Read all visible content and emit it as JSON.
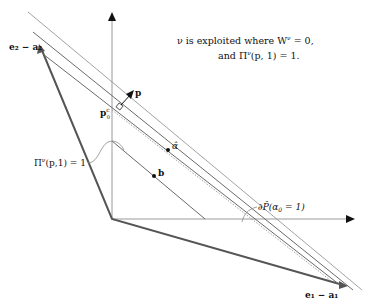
{
  "annotation": {
    "line1": "ν is exploited where W",
    "line1_sup": "ν",
    "line1_tail": " = 0,",
    "line2_pre": "and Π",
    "line2_sup": "ν",
    "line2_tail": "(p, 1) = 1."
  },
  "labels": {
    "e2_minus_a2": "e₂ − a₂",
    "e1_minus_a1": "e₁ − a₁",
    "p": "p",
    "p0c": "p",
    "p0c_sup": "c",
    "p0c_sub": "0",
    "alpha_hat": "α̂",
    "b": "b",
    "pi_curve": "Π",
    "pi_curve_sup": "ν",
    "pi_curve_tail": "(p,1) = 1",
    "boundary": "∂P̂(α",
    "boundary_sub": "0",
    "boundary_tail": " = 1)"
  },
  "colors": {
    "axis": "#9a9a9a",
    "thick": "#555555",
    "line": "#6a6a6a",
    "dotted": "#8a8a8a",
    "text": "#111111"
  }
}
